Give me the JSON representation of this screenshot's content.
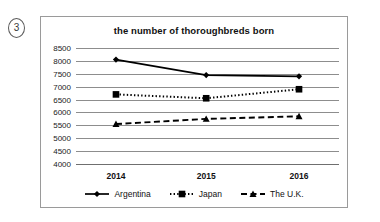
{
  "item_marker": "3",
  "chart_data": {
    "type": "line",
    "title": "the number of thoroughbreds born",
    "xlabel": "",
    "ylabel": "",
    "categories": [
      "2014",
      "2015",
      "2016"
    ],
    "ylim": [
      4000,
      8500
    ],
    "ytick_step": 500,
    "yticks": [
      "8500",
      "8000",
      "7500",
      "7000",
      "6500",
      "6000",
      "5500",
      "5000",
      "4500",
      "4000"
    ],
    "grid": true,
    "legend_position": "bottom",
    "series": [
      {
        "name": "Argentina",
        "values": [
          8050,
          7450,
          7400
        ],
        "line_style": "solid",
        "marker": "diamond",
        "color": "#000000"
      },
      {
        "name": "Japan",
        "values": [
          6700,
          6550,
          6900
        ],
        "line_style": "dotted",
        "marker": "square",
        "color": "#000000"
      },
      {
        "name": "The U.K.",
        "values": [
          5550,
          5750,
          5850
        ],
        "line_style": "dashed",
        "marker": "triangle",
        "color": "#000000"
      }
    ]
  }
}
